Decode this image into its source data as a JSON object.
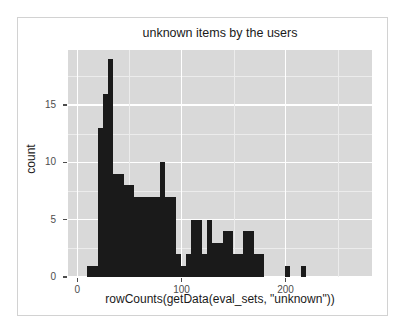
{
  "chart_data": {
    "type": "bar",
    "title": "unknown items by the users",
    "xlabel": "rowCounts(getData(eval_sets, \"unknown\"))",
    "ylabel": "count",
    "xlim": [
      -9,
      283
    ],
    "ylim": [
      0,
      19.8
    ],
    "grid": true,
    "legend": null,
    "bin_width": 5,
    "bar_color": "#1a1a1a",
    "panel_color": "#d9d9d9",
    "grid_color": "#ffffff",
    "xticks": [
      0,
      100,
      200
    ],
    "xtick_labels": [
      "0",
      "100",
      "200"
    ],
    "yticks": [
      0,
      5,
      10,
      15
    ],
    "ytick_labels": [
      "0",
      "5",
      "10",
      "15"
    ],
    "x": [
      12,
      17,
      22,
      27,
      32,
      37,
      42,
      47,
      52,
      57,
      62,
      67,
      72,
      77,
      82,
      87,
      92,
      97,
      102,
      107,
      112,
      117,
      122,
      127,
      132,
      137,
      142,
      147,
      152,
      157,
      162,
      167,
      172,
      177,
      182,
      187,
      192,
      197,
      202,
      207,
      212,
      217,
      222,
      227,
      232,
      237,
      242,
      247,
      252
    ],
    "values": [
      1,
      1,
      13,
      16,
      19,
      9,
      9,
      8,
      8,
      7,
      7,
      7,
      7,
      7,
      10,
      7,
      7,
      2,
      1,
      2,
      5,
      5,
      2,
      5,
      3,
      3,
      4,
      4,
      2,
      2,
      4,
      4,
      2,
      2,
      0,
      0,
      0,
      0,
      1,
      0,
      0,
      1,
      0,
      0,
      0,
      0,
      0,
      0,
      0
    ],
    "categories": [
      "12",
      "17",
      "22",
      "27",
      "32",
      "37",
      "42",
      "47",
      "52",
      "57",
      "62",
      "67",
      "72",
      "77",
      "82",
      "87",
      "92",
      "97",
      "102",
      "107",
      "112",
      "117",
      "122",
      "127",
      "132",
      "137",
      "142",
      "147",
      "152",
      "157",
      "162",
      "167",
      "172",
      "177",
      "182",
      "187",
      "192",
      "197",
      "202",
      "207",
      "212",
      "217",
      "222",
      "227",
      "232",
      "237",
      "242",
      "247",
      "252"
    ]
  }
}
